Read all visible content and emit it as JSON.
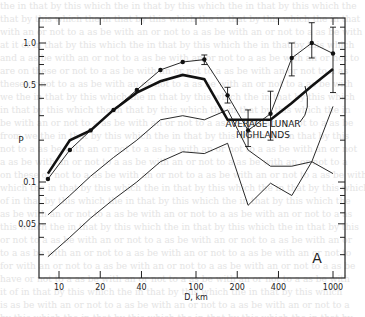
{
  "chart_data": {
    "type": "line",
    "title": "",
    "panel_label": "A",
    "xlabel": "D, km",
    "ylabel": "P",
    "xscale": "log",
    "yscale": "log",
    "xlim": [
      7,
      1200
    ],
    "ylim": [
      0.025,
      1.4
    ],
    "xticks": [
      10,
      20,
      40,
      100,
      200,
      400,
      1000
    ],
    "xtick_labels": [
      "10",
      "20",
      "40",
      "100",
      "200",
      "400",
      "1000"
    ],
    "yticks": [
      0.05,
      0.1,
      0.5,
      1.0
    ],
    "ytick_labels": [
      "0.05",
      "0.1",
      "0.5",
      "1.0"
    ],
    "grid": false,
    "legend": null,
    "annotations": [
      {
        "text": "AVERAGE LUNAR",
        "x": 250,
        "y": 0.17
      },
      {
        "text": "HIGHLANDS",
        "x": 250,
        "y": 0.145
      },
      {
        "text": "A",
        "x": 800,
        "y": 0.035
      }
    ],
    "series": [
      {
        "name": "Observed (with error bars)",
        "style": "thin line with dots",
        "x": [
          8.3,
          12,
          17,
          25,
          37,
          55,
          80,
          115,
          170,
          240,
          350,
          500,
          700,
          1000
        ],
        "y": [
          0.105,
          0.17,
          0.235,
          0.33,
          0.46,
          0.64,
          0.73,
          0.76,
          0.42,
          0.235,
          0.31,
          0.78,
          1.0,
          0.84
        ],
        "y_err_low": [
          null,
          null,
          null,
          null,
          null,
          null,
          null,
          0.7,
          0.37,
          0.18,
          0.2,
          0.58,
          0.78,
          0.44
        ],
        "y_err_high": [
          null,
          null,
          null,
          null,
          null,
          null,
          0.76,
          0.82,
          0.48,
          0.33,
          0.45,
          1.0,
          1.4,
          1.3
        ]
      },
      {
        "name": "Average Lunar Highlands",
        "style": "thick line",
        "x": [
          8.3,
          12,
          17,
          25,
          37,
          55,
          80,
          115,
          170,
          240,
          350,
          500,
          700,
          1000
        ],
        "y": [
          0.115,
          0.2,
          0.235,
          0.33,
          0.44,
          0.53,
          0.59,
          0.55,
          0.28,
          0.28,
          0.28,
          0.37,
          0.49,
          0.65
        ]
      },
      {
        "name": "Curve 3",
        "style": "thin line",
        "x": [
          8.3,
          12,
          17,
          25,
          37,
          55,
          80,
          115,
          170,
          240,
          350,
          500,
          700,
          1000
        ],
        "y": [
          0.058,
          0.08,
          0.11,
          0.15,
          0.2,
          0.28,
          0.3,
          0.28,
          0.33,
          0.17,
          0.13,
          0.13,
          0.14,
          0.35
        ]
      },
      {
        "name": "Curve 4",
        "style": "thin line",
        "x": [
          8.3,
          12,
          17,
          25,
          37,
          55,
          80,
          115,
          170,
          240,
          350,
          500,
          700,
          1000
        ],
        "y": [
          0.029,
          0.04,
          0.055,
          0.075,
          0.1,
          0.14,
          0.165,
          0.16,
          0.19,
          0.068,
          0.098,
          0.08,
          0.14,
          0.115
        ]
      }
    ]
  }
}
